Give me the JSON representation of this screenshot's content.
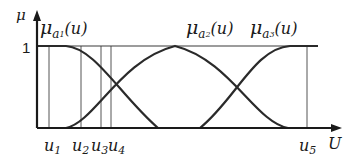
{
  "diagram": {
    "y_axis_label": "μ",
    "x_axis_label": "U",
    "level_one_label": "1",
    "membership_functions": [
      {
        "id": "a1",
        "label_main": "μ",
        "label_sub": "a",
        "label_subsub": "1",
        "label_arg": "(u)",
        "shape": "Z-shaped (descending)"
      },
      {
        "id": "a2",
        "label_main": "μ",
        "label_sub": "a",
        "label_subsub": "2",
        "label_arg": "(u)",
        "shape": "bell-shaped"
      },
      {
        "id": "a3",
        "label_main": "μ",
        "label_sub": "a",
        "label_subsub": "3",
        "label_arg": "(u)",
        "shape": "S-shaped (ascending)"
      }
    ],
    "points": [
      {
        "id": "u1",
        "main": "u",
        "sub": "1"
      },
      {
        "id": "u2",
        "main": "u",
        "sub": "2"
      },
      {
        "id": "u3",
        "main": "u",
        "sub": "3"
      },
      {
        "id": "u4",
        "main": "u",
        "sub": "4"
      },
      {
        "id": "u5",
        "main": "u",
        "sub": "5"
      }
    ],
    "colors": {
      "curve": "#2a2a2a",
      "axis": "#1a1a1a",
      "guide_line": "#555555"
    }
  }
}
